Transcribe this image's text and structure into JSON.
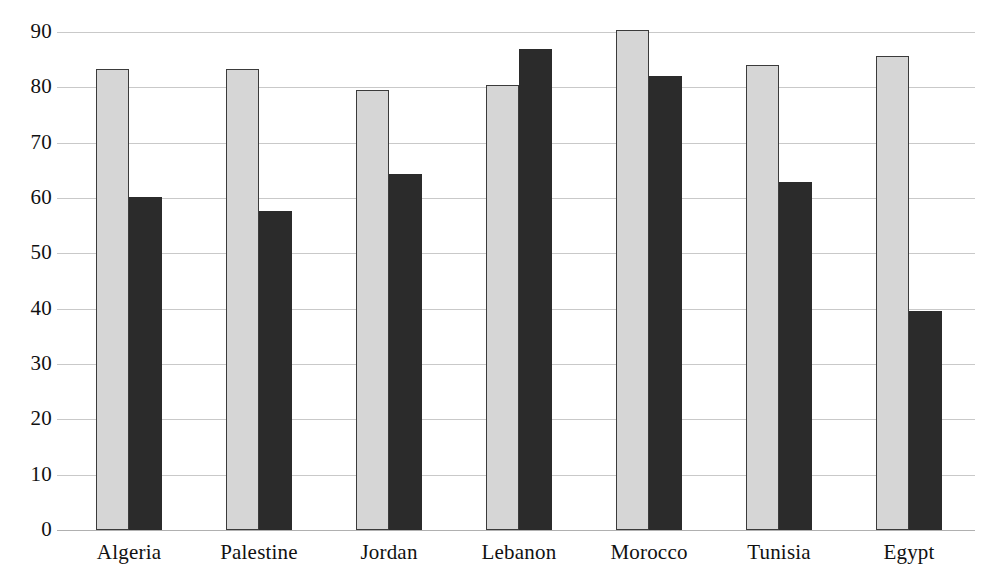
{
  "chart_data": {
    "type": "bar",
    "title": "",
    "subtitle": "",
    "xlabel": "",
    "ylabel": "",
    "categories": [
      "Algeria",
      "Palestine",
      "Jordan",
      "Lebanon",
      "Morocco",
      "Tunisia",
      "Egypt"
    ],
    "series": [
      {
        "name": "series-1",
        "color": "#d6d6d6",
        "values": [
          83.3,
          83.3,
          79.6,
          80.4,
          90.3,
          84.0,
          85.6
        ]
      },
      {
        "name": "series-2",
        "color": "#2b2b2b",
        "values": [
          60.2,
          57.6,
          64.3,
          86.9,
          82.0,
          62.9,
          39.5
        ]
      }
    ],
    "ylim": [
      0,
      90
    ],
    "ytick_step": 10,
    "yticks": [
      0,
      10,
      20,
      30,
      40,
      50,
      60,
      70,
      80,
      90
    ],
    "ytick_labels": [
      "0",
      "10",
      "20",
      "30",
      "40",
      "50",
      "60",
      "70",
      "80",
      "90"
    ],
    "grid": true,
    "grid_axis": "y",
    "legend": null,
    "legend_position": "none",
    "annotations": []
  },
  "geometry": {
    "plot_left": 57,
    "plot_right": 975,
    "baseline_y": 530,
    "top_y": 32,
    "bar_width": 33,
    "group_pitch": 130,
    "first_group_left": 39
  },
  "colors": {
    "background": "#ffffff",
    "gridline": "#c9c9c9",
    "baseline": "#b0b0b0",
    "bar_light_fill": "#d6d6d6",
    "bar_light_border": "#3b3b3b",
    "bar_dark_fill": "#2b2b2b",
    "text": "#111111"
  }
}
